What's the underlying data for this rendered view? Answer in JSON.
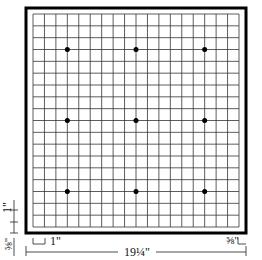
{
  "diagram": {
    "title": "",
    "board": {
      "columns": 19,
      "rows": 19,
      "star_points": 9
    },
    "dimensions": {
      "width_label": "19¼\"",
      "cell_label": "1\"",
      "margin_label": "⅝\"",
      "side_cell_label": "1\"",
      "side_margin_label": "⅝\""
    },
    "colors": {
      "line": "#111111",
      "frame": "#000000",
      "background": "#ffffff"
    }
  }
}
